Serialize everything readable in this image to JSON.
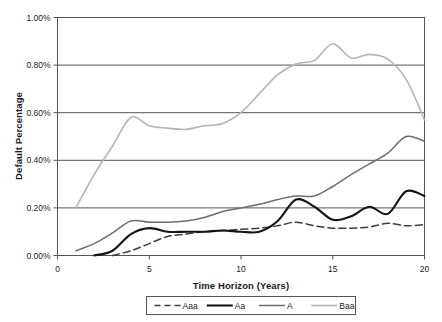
{
  "chart_data": {
    "type": "line",
    "title": "",
    "xlabel": "Time Horizon (Years)",
    "ylabel": "Default Percentage",
    "xlim": [
      0,
      20
    ],
    "ylim": [
      0,
      1.0
    ],
    "xticks": [
      "0",
      "5",
      "10",
      "15",
      "20"
    ],
    "xtick_values": [
      0,
      5,
      10,
      15,
      20
    ],
    "yticks": [
      "0.00%",
      "0.20%",
      "0.40%",
      "0.60%",
      "0.80%",
      "1.00%"
    ],
    "ytick_values": [
      0.0,
      0.2,
      0.4,
      0.6,
      0.8,
      1.0
    ],
    "grid": "horizontal",
    "legend_position": "bottom",
    "units": "percent",
    "x": [
      1,
      2,
      3,
      4,
      5,
      6,
      7,
      8,
      9,
      10,
      11,
      12,
      13,
      14,
      15,
      16,
      17,
      18,
      19,
      20
    ],
    "series": [
      {
        "name": "Aaa",
        "style": "dashed",
        "color": "#3c3c3c",
        "width": 1.5,
        "start_year": 3,
        "values": [
          null,
          null,
          0.0,
          0.02,
          0.05,
          0.08,
          0.09,
          0.1,
          0.105,
          0.11,
          0.115,
          0.125,
          0.14,
          0.125,
          0.115,
          0.115,
          0.12,
          0.135,
          0.125,
          0.13
        ]
      },
      {
        "name": "Aa",
        "style": "solid",
        "color": "#141414",
        "width": 2.1,
        "start_year": 2,
        "values": [
          null,
          0.0,
          0.02,
          0.09,
          0.115,
          0.1,
          0.1,
          0.1,
          0.105,
          0.1,
          0.1,
          0.145,
          0.235,
          0.205,
          0.15,
          0.165,
          0.205,
          0.175,
          0.27,
          0.25
        ]
      },
      {
        "name": "A",
        "style": "solid",
        "color": "#6e6e6e",
        "width": 1.5,
        "start_year": 1,
        "values": [
          0.02,
          0.05,
          0.095,
          0.145,
          0.14,
          0.14,
          0.145,
          0.16,
          0.185,
          0.2,
          0.215,
          0.235,
          0.25,
          0.25,
          0.29,
          0.34,
          0.385,
          0.43,
          0.5,
          0.48
        ]
      },
      {
        "name": "Baa",
        "style": "solid",
        "color": "#b4b4b4",
        "width": 1.6,
        "start_year": 1,
        "values": [
          0.2,
          0.34,
          0.46,
          0.58,
          0.545,
          0.535,
          0.53,
          0.545,
          0.555,
          0.6,
          0.68,
          0.76,
          0.805,
          0.82,
          0.89,
          0.83,
          0.845,
          0.825,
          0.74,
          0.57
        ]
      }
    ]
  },
  "legend": {
    "items": [
      {
        "label": "Aaa"
      },
      {
        "label": "Aa"
      },
      {
        "label": "A"
      },
      {
        "label": "Baa"
      }
    ]
  }
}
